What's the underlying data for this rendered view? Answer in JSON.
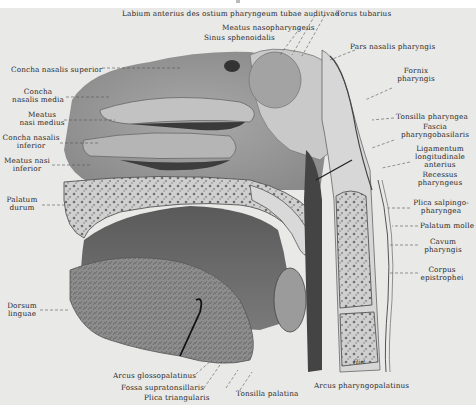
{
  "figure": {
    "background": "#e9e9e8",
    "ink": "#2a2a2a"
  },
  "labels": {
    "top": [
      {
        "id": "labium-anterius",
        "text": "Labium anterius des ostium pharyngeum tubae auditivae"
      },
      {
        "id": "torus-tubarius",
        "text": "Torus tubarius"
      },
      {
        "id": "meatus-nasopharyngeus",
        "text": "Meatus nasopharyngeus"
      },
      {
        "id": "sinus-sphenoidalis",
        "text": "Sinus sphenoidalis"
      },
      {
        "id": "pars-nasalis",
        "text": "Pars nasalis pharyngis"
      }
    ],
    "left": [
      {
        "id": "concha-superior",
        "text": "Concha nasalis superior"
      },
      {
        "id": "concha-media",
        "line1": "Concha",
        "line2": "nasalis media"
      },
      {
        "id": "meatus-medius",
        "line1": "Meatus",
        "line2": "nasi medius"
      },
      {
        "id": "concha-inferior",
        "line1": "Concha nasalis",
        "line2": "inferior"
      },
      {
        "id": "meatus-inferior",
        "line1": "Meatus nasi",
        "line2": "inferior"
      },
      {
        "id": "palatum-durum",
        "line1": "Palatum",
        "line2": "durum"
      },
      {
        "id": "dorsum-linguae",
        "line1": "Dorsum",
        "line2": "linguae"
      }
    ],
    "right": [
      {
        "id": "fornix",
        "line1": "Fornix",
        "line2": "pharyngis"
      },
      {
        "id": "tonsilla-pharyngea",
        "text": "Tonsilla pharyngea"
      },
      {
        "id": "fascia",
        "line1": "Fascia",
        "line2": "pharyngobasilaris"
      },
      {
        "id": "ligamentum",
        "line1": "Ligamentum",
        "line2": "longitudinale",
        "line3": "anterius"
      },
      {
        "id": "recessus",
        "line1": "Recessus",
        "line2": "pharyngeus"
      },
      {
        "id": "plica-salpingo",
        "line1": "Plica salpingo-",
        "line2": "pharyngea"
      },
      {
        "id": "palatum-molle",
        "text": "Palatum molle"
      },
      {
        "id": "cavum",
        "line1": "Cavum",
        "line2": "pharyngis"
      },
      {
        "id": "corpus",
        "line1": "Corpus",
        "line2": "epistrophei"
      }
    ],
    "bottom": [
      {
        "id": "arcus-glosso",
        "text": "Arcus glossopalatinus"
      },
      {
        "id": "fossa",
        "text": "Fossa supratonsillaris"
      },
      {
        "id": "plica-tri",
        "text": "Plica triangularis"
      },
      {
        "id": "tonsilla-palatina",
        "text": "Tonsilla palatina"
      },
      {
        "id": "arcus-pharyngo",
        "text": "Arcus pharyngopalatinus"
      }
    ]
  },
  "signature": "Hirt"
}
